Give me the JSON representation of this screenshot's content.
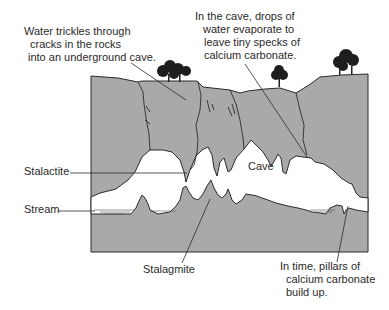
{
  "colors": {
    "rock": "#a9a9a9",
    "outline": "#2b2b2b",
    "cave": "#ffffff",
    "tree": "#1e1e1e",
    "text": "#2a2a2a",
    "background": "#ffffff"
  },
  "labels": {
    "water_trickles": {
      "lines": [
        "Water trickles through",
        "cracks in the rocks",
        "into an underground cave."
      ]
    },
    "drops_evaporate": {
      "lines": [
        "In the cave, drops of",
        "water evaporate to",
        "leave tiny specks of",
        "calcium carbonate."
      ]
    },
    "stalactite": "Stalactite",
    "stream": "Stream",
    "cave": "Cave",
    "stalagmite": "Stalagmite",
    "pillars": {
      "lines": [
        "In time, pillars of",
        "calcium carbonate",
        "build up."
      ]
    }
  }
}
